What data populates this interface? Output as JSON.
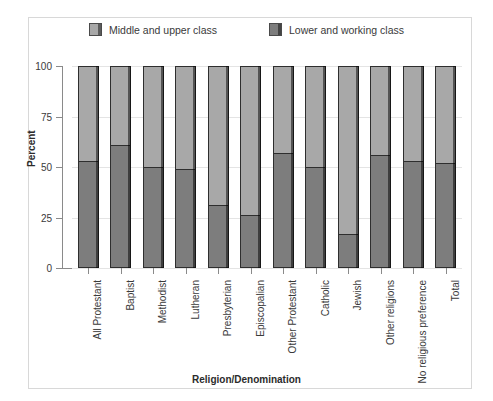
{
  "chart_data": {
    "type": "bar",
    "title": "",
    "xlabel": "Religion/Denomination",
    "ylabel": "Percent",
    "ylim": [
      0,
      100
    ],
    "yticks": [
      0,
      25,
      50,
      75,
      100
    ],
    "grid": true,
    "stacked": true,
    "legend_position": "top",
    "categories": [
      "All Protestant",
      "Baptist",
      "Methodist",
      "Lutheran",
      "Presbyterian",
      "Episcopalian",
      "Other Protestant",
      "Catholic",
      "Jewish",
      "Other religions",
      "No religious preference",
      "Total"
    ],
    "series": [
      {
        "name": "Lower and working class",
        "color": "#7d7d7d",
        "values": [
          53,
          61,
          50,
          49,
          31,
          26,
          57,
          50,
          17,
          56,
          53,
          52
        ]
      },
      {
        "name": "Middle and upper class",
        "color": "#a8a8a8",
        "values": [
          47,
          39,
          50,
          51,
          69,
          74,
          43,
          50,
          83,
          44,
          47,
          48
        ]
      }
    ]
  },
  "legend": {
    "items": [
      {
        "label": "Middle and upper class",
        "color": "#a8a8a8"
      },
      {
        "label": "Lower and working class",
        "color": "#7d7d7d"
      }
    ]
  },
  "axes": {
    "y_title": "Percent",
    "x_title": "Religion/Denomination",
    "y_tick_labels": [
      "100",
      "75",
      "50",
      "25",
      "0"
    ]
  }
}
